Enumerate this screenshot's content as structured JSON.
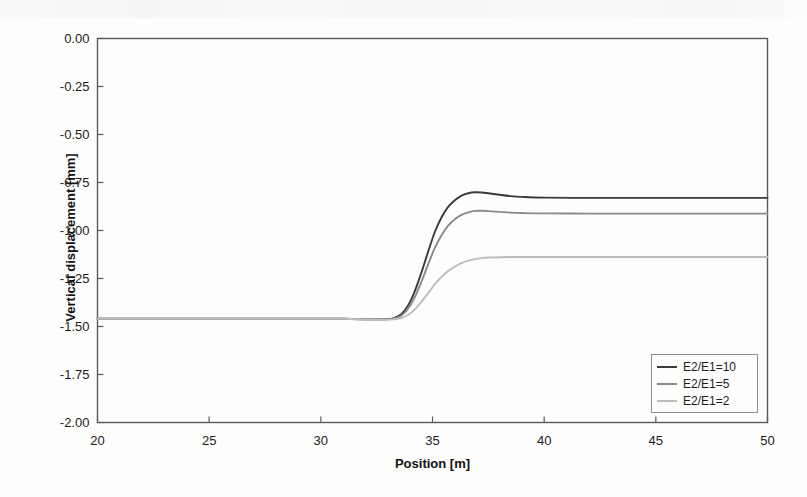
{
  "chart_data": {
    "type": "line",
    "title": "",
    "xlabel": "Position [m]",
    "ylabel": "Vertical displacement [mm]",
    "xlim": [
      20,
      50
    ],
    "ylim": [
      -2.0,
      0.0
    ],
    "xticks": [
      20,
      25,
      30,
      35,
      40,
      45,
      50
    ],
    "xtick_labels": [
      "20",
      "25",
      "30",
      "35",
      "40",
      "45",
      "50"
    ],
    "yticks": [
      0.0,
      -0.25,
      -0.5,
      -0.75,
      -1.0,
      -1.25,
      -1.5,
      -1.75,
      -2.0
    ],
    "ytick_labels": [
      "0.00",
      "-0.25",
      "-0.50",
      "-0.75",
      "-1.00",
      "-1.25",
      "-1.50",
      "-1.75",
      "-2.00"
    ],
    "grid": false,
    "legend_position": "lower-right",
    "x": [
      20,
      22,
      24,
      26,
      28,
      30,
      31,
      32,
      32.5,
      33,
      33.3,
      33.6,
      33.9,
      34.2,
      34.5,
      34.8,
      35.1,
      35.4,
      35.7,
      36,
      36.3,
      36.6,
      36.9,
      37.2,
      37.5,
      38,
      38.5,
      39,
      40,
      42,
      44,
      46,
      48,
      50
    ],
    "series": [
      {
        "name": "E2/E1=10",
        "color": "#3a3a3a",
        "plateau_left": -1.46,
        "plateau_right": -0.83,
        "overshoot": -0.8,
        "values": [
          -1.46,
          -1.46,
          -1.46,
          -1.46,
          -1.46,
          -1.46,
          -1.46,
          -1.462,
          -1.463,
          -1.461,
          -1.455,
          -1.436,
          -1.392,
          -1.318,
          -1.22,
          -1.112,
          -1.009,
          -0.932,
          -0.877,
          -0.842,
          -0.818,
          -0.806,
          -0.801,
          -0.802,
          -0.806,
          -0.814,
          -0.821,
          -0.825,
          -0.829,
          -0.83,
          -0.83,
          -0.83,
          -0.83,
          -0.83
        ]
      },
      {
        "name": "E2/E1=5",
        "color": "#8a8a8a",
        "plateau_left": -1.46,
        "plateau_right": -0.91,
        "overshoot": -0.89,
        "values": [
          -1.46,
          -1.46,
          -1.46,
          -1.46,
          -1.46,
          -1.46,
          -1.46,
          -1.462,
          -1.463,
          -1.462,
          -1.458,
          -1.444,
          -1.409,
          -1.349,
          -1.268,
          -1.178,
          -1.092,
          -1.026,
          -0.975,
          -0.941,
          -0.919,
          -0.906,
          -0.898,
          -0.897,
          -0.899,
          -0.903,
          -0.907,
          -0.909,
          -0.911,
          -0.912,
          -0.912,
          -0.912,
          -0.912,
          -0.912
        ]
      },
      {
        "name": "E2/E1=2",
        "color": "#bcbcbc",
        "plateau_left": -1.46,
        "plateau_right": -1.14,
        "overshoot": -1.13,
        "values": [
          -1.46,
          -1.46,
          -1.46,
          -1.46,
          -1.46,
          -1.46,
          -1.46,
          -1.463,
          -1.464,
          -1.464,
          -1.462,
          -1.456,
          -1.44,
          -1.412,
          -1.372,
          -1.327,
          -1.281,
          -1.242,
          -1.211,
          -1.188,
          -1.17,
          -1.157,
          -1.149,
          -1.144,
          -1.141,
          -1.139,
          -1.138,
          -1.138,
          -1.138,
          -1.138,
          -1.138,
          -1.138,
          -1.138,
          -1.138
        ]
      }
    ]
  },
  "legend": {
    "entries": [
      {
        "label": "E2/E1=10"
      },
      {
        "label": "E2/E1=5"
      },
      {
        "label": "E2/E1=2"
      }
    ]
  },
  "style": {
    "axis_color": "#5a5a5a",
    "text_color": "#1c1c1c",
    "background": "#fdfdfc"
  }
}
